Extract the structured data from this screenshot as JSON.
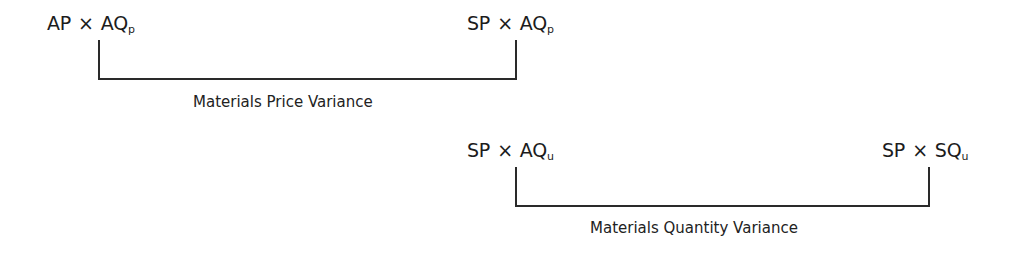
{
  "diagram": {
    "price_variance": {
      "left_term": {
        "factor_a": "AP",
        "operator": "×",
        "factor_b": "AQ",
        "subscript": "p"
      },
      "right_term": {
        "factor_a": "SP",
        "operator": "×",
        "factor_b": "AQ",
        "subscript": "p"
      },
      "label": "Materials Price Variance"
    },
    "quantity_variance": {
      "left_term": {
        "factor_a": "SP",
        "operator": "×",
        "factor_b": "AQ",
        "subscript": "u"
      },
      "right_term": {
        "factor_a": "SP",
        "operator": "×",
        "factor_b": "SQ",
        "subscript": "u"
      },
      "label": "Materials Quantity Variance"
    },
    "line_color": "#2a2a2a",
    "text_color": "#1c1c1c"
  }
}
